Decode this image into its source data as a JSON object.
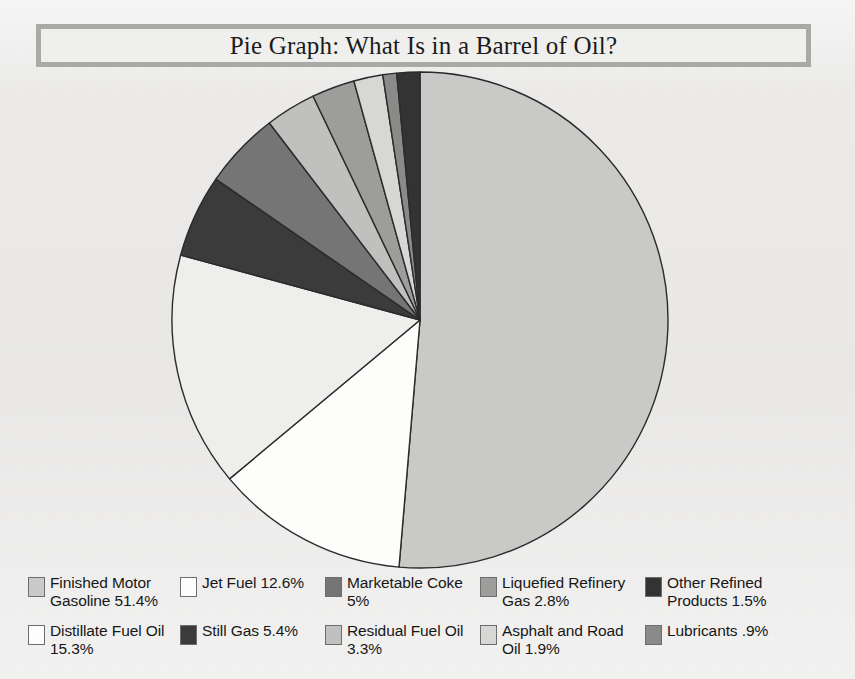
{
  "title": "Pie Graph: What Is in a Barrel of Oil?",
  "chart_data": {
    "type": "pie",
    "title": "Pie Graph: What Is in a Barrel of Oil?",
    "xlabel": "",
    "ylabel": "",
    "legend_position": "bottom",
    "grid": false,
    "units": "percent",
    "start_angle_deg": 0,
    "direction": "clockwise",
    "categories": [
      "Finished Motor Gasoline",
      "Jet Fuel",
      "Distillate Fuel Oil",
      "Still Gas",
      "Marketable Coke",
      "Residual Fuel Oil",
      "Liquefied Refinery Gas",
      "Asphalt and Road Oil",
      "Lubricants",
      "Other Refined Products"
    ],
    "values": [
      51.4,
      12.6,
      15.3,
      5.4,
      5.0,
      3.3,
      2.8,
      1.9,
      0.9,
      1.5
    ],
    "value_labels": [
      "51.4%",
      "12.6%",
      "15.3%",
      "5.4%",
      "5%",
      "3.3%",
      "2.8%",
      "1.9%",
      ".9%",
      "1.5%"
    ],
    "colors": [
      "#c9c9c7",
      "#fdfdfc",
      "#eeeeec",
      "#3b3b3b",
      "#757575",
      "#c0c0be",
      "#9d9d9b",
      "#d7d7d5",
      "#8a8a88",
      "#333333"
    ],
    "slice_stroke": "#2b2b2b"
  },
  "legend": {
    "rows": [
      {
        "items": [
          {
            "label": "Finished Motor Gasoline 51.4%",
            "color": "#c9c9c7",
            "name": "finished-motor-gasoline",
            "width": 152,
            "left": 20
          },
          {
            "label": "Jet Fuel 12.6%",
            "color": "#fdfdfc",
            "name": "jet-fuel",
            "width": 145,
            "left": 172
          },
          {
            "label": "Marketable Coke 5%",
            "color": "#757575",
            "name": "marketable-coke",
            "width": 155,
            "left": 317
          },
          {
            "label": "Liquefied Refinery Gas 2.8%",
            "color": "#9d9d9b",
            "name": "liquefied-refinery-gas",
            "width": 165,
            "left": 472
          },
          {
            "label": "Other Refined Products 1.5%",
            "color": "#333333",
            "name": "other-refined-products",
            "width": 180,
            "left": 637
          }
        ]
      },
      {
        "items": [
          {
            "label": "Distillate Fuel Oil 15.3%",
            "color": "#fdfdfc",
            "name": "distillate-fuel-oil",
            "width": 152,
            "left": 20
          },
          {
            "label": "Still Gas 5.4%",
            "color": "#3b3b3b",
            "name": "still-gas",
            "width": 145,
            "left": 172
          },
          {
            "label": "Residual Fuel Oil 3.3%",
            "color": "#c0c0be",
            "name": "residual-fuel-oil",
            "width": 155,
            "left": 317
          },
          {
            "label": "Asphalt and Road Oil 1.9%",
            "color": "#d7d7d5",
            "name": "asphalt-and-road-oil",
            "width": 165,
            "left": 472
          },
          {
            "label": "Lubricants .9%",
            "color": "#8a8a88",
            "name": "lubricants",
            "width": 180,
            "left": 637
          }
        ]
      }
    ]
  }
}
